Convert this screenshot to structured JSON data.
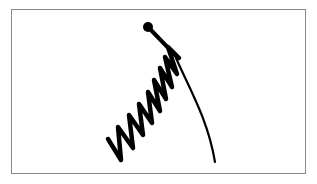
{
  "figure": {
    "caption": "",
    "stroke_color": "#000000",
    "frame_color": "#8a8a8a",
    "background_color": "#ffffff",
    "elements": {
      "ball": {
        "cx": 148,
        "cy": 27,
        "r": 5
      },
      "stem": {
        "from": [
          148,
          27
        ],
        "to": [
          178,
          58
        ]
      },
      "coil": {
        "points": [
          [
            108,
            139
          ],
          [
            121,
            160
          ],
          [
            118,
            127
          ],
          [
            133,
            148
          ],
          [
            129,
            115
          ],
          [
            143,
            135
          ],
          [
            139,
            104
          ],
          [
            152,
            123
          ],
          [
            148,
            92
          ],
          [
            160,
            111
          ],
          [
            154,
            80
          ],
          [
            166,
            99
          ],
          [
            160,
            68
          ],
          [
            172,
            87
          ],
          [
            165,
            57
          ],
          [
            177,
            74
          ],
          [
            168,
            47
          ],
          [
            179,
            58
          ]
        ]
      },
      "tail": {
        "d": "M176 58 C 190 90, 208 120, 215 162"
      }
    }
  }
}
